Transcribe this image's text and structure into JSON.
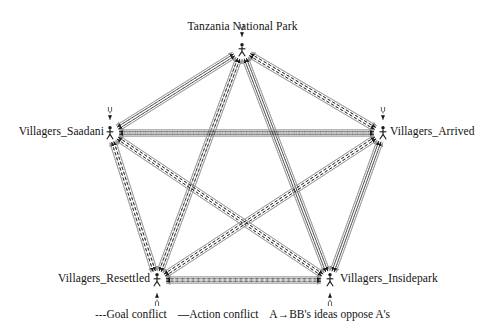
{
  "diagram": {
    "type": "pentagon-conflict-network",
    "title_text": "",
    "nodes": [
      {
        "id": "tnp",
        "label": "Tanzania National Park",
        "x": 242,
        "y": 50,
        "label_x": 242,
        "label_y": 28,
        "label_align": "center",
        "icon": "stick-figure-icon"
      },
      {
        "id": "saadani",
        "label": "Villagers_Saadani",
        "x": 110,
        "y": 133,
        "label_x": 104,
        "label_y": 133,
        "label_align": "right",
        "icon": "stick-figure-icon"
      },
      {
        "id": "arrived",
        "label": "Villagers_Arrived",
        "x": 383,
        "y": 133,
        "label_x": 390,
        "label_y": 133,
        "label_align": "left",
        "icon": "stick-figure-icon"
      },
      {
        "id": "resettled",
        "label": "Villagers_Resettled",
        "x": 157,
        "y": 280,
        "label_x": 150,
        "label_y": 280,
        "label_align": "right",
        "icon": "stick-figure-icon"
      },
      {
        "id": "insidepark",
        "label": "Villagers_Insidepark",
        "x": 330,
        "y": 280,
        "label_x": 340,
        "label_y": 280,
        "label_align": "left",
        "icon": "stick-figure-icon"
      }
    ],
    "edges": [
      {
        "source": "tnp",
        "target": "saadani",
        "kinds": [
          "action-conflict",
          "goal-conflict"
        ],
        "bidirectional": true
      },
      {
        "source": "tnp",
        "target": "arrived",
        "kinds": [
          "action-conflict",
          "goal-conflict"
        ],
        "bidirectional": true
      },
      {
        "source": "tnp",
        "target": "resettled",
        "kinds": [
          "action-conflict",
          "goal-conflict"
        ],
        "bidirectional": true
      },
      {
        "source": "tnp",
        "target": "insidepark",
        "kinds": [
          "action-conflict",
          "goal-conflict"
        ],
        "bidirectional": true
      },
      {
        "source": "saadani",
        "target": "arrived",
        "kinds": [
          "action-conflict",
          "goal-conflict"
        ],
        "bidirectional": true
      },
      {
        "source": "saadani",
        "target": "resettled",
        "kinds": [
          "action-conflict",
          "goal-conflict"
        ],
        "bidirectional": true
      },
      {
        "source": "saadani",
        "target": "insidepark",
        "kinds": [
          "action-conflict",
          "goal-conflict"
        ],
        "bidirectional": true
      },
      {
        "source": "arrived",
        "target": "resettled",
        "kinds": [
          "action-conflict",
          "goal-conflict"
        ],
        "bidirectional": true
      },
      {
        "source": "arrived",
        "target": "insidepark",
        "kinds": [
          "action-conflict",
          "goal-conflict"
        ],
        "bidirectional": true
      },
      {
        "source": "resettled",
        "target": "insidepark",
        "kinds": [
          "action-conflict",
          "goal-conflict"
        ],
        "bidirectional": true
      }
    ],
    "self_loops": [
      {
        "node": "tnp",
        "x": 242,
        "y": 50,
        "side": "top"
      },
      {
        "node": "saadani",
        "x": 110,
        "y": 133,
        "side": "top"
      },
      {
        "node": "arrived",
        "x": 383,
        "y": 133,
        "side": "top"
      },
      {
        "node": "resettled",
        "x": 157,
        "y": 280,
        "side": "bottom"
      },
      {
        "node": "insidepark",
        "x": 330,
        "y": 280,
        "side": "bottom"
      }
    ],
    "colors": {
      "action_conflict": "#9a9a9a",
      "goal_conflict": "#1a1a1a",
      "node": "#1a1a1a",
      "background": "#ffffff",
      "text": "#111111"
    }
  },
  "legend": {
    "goal_conflict": {
      "dash_glyph": "---",
      "label": "Goal conflict"
    },
    "action_conflict": {
      "dash_glyph": "—",
      "label": "Action conflict"
    },
    "direction": {
      "from": "A",
      "arrow": "→",
      "to": "B",
      "label": "B's ideas oppose A's"
    }
  }
}
